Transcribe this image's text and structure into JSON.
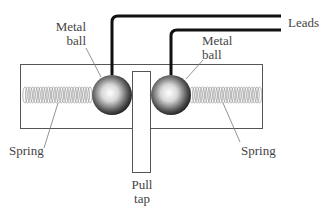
{
  "diagram": {
    "labels": {
      "leads": "Leads",
      "metal_ball_left_line1": "Metal",
      "metal_ball_left_line2": "ball",
      "metal_ball_right_line1": "Metal",
      "metal_ball_right_line2": "ball",
      "spring_left": "Spring",
      "spring_right": "Spring",
      "pull_tap_line1": "Pull",
      "pull_tap_line2": "tap"
    },
    "colors": {
      "line": "#111111",
      "box": "#555555",
      "spring": "#777777",
      "ball_light": "#ffffff",
      "ball_dark": "#111111"
    }
  }
}
